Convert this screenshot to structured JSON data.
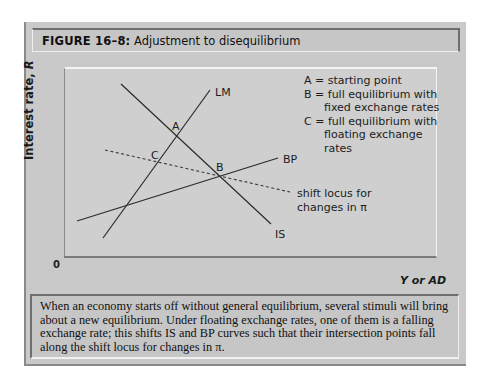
{
  "figure": {
    "label": "FIGURE 16–8:",
    "title": "Adjustment to disequilibrium"
  },
  "axes": {
    "ylabel": "Interest rate, ",
    "ylabel_var": "R",
    "xlabel": "Y or AD",
    "origin": "0"
  },
  "curves": {
    "lm": "LM",
    "is": "IS",
    "bp": "BP",
    "shift_locus_line1": "shift locus for",
    "shift_locus_line2": "changes in π"
  },
  "points": {
    "a": "A",
    "b": "B",
    "c": "C"
  },
  "legend": {
    "line1": "A = starting point",
    "line2": "B = full equilibrium with",
    "line3": "fixed exchange rates",
    "line4": "C = full equilibrium with",
    "line5": "floating exchange",
    "line6": "rates"
  },
  "caption": "When an economy starts off without general equilibrium, several stimuli will bring about a new equilibrium. Under floating exchange rates, one of them is a falling exchange rate; this shifts IS and BP curves such that their intersection points fall along the shift locus for changes in π.",
  "colors": {
    "frame": "#c9c9c9",
    "plot_bg": "#cfcfcf",
    "line": "#2a2a2a"
  }
}
